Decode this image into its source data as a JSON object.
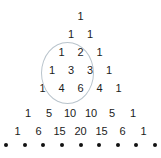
{
  "figure": {
    "name": "pascals-triangle-with-highlight",
    "background_color": "#ffffff",
    "text_color": "#1b1b1b",
    "highlight_color": "#b9c4cc",
    "dot_color": "#111111"
  },
  "chart_data": {
    "type": "table",
    "title": "",
    "subtitle": "",
    "xlabel": "",
    "ylabel": "",
    "grid": false,
    "legend": null,
    "rows": [
      {
        "index": 0,
        "values": [
          1
        ]
      },
      {
        "index": 1,
        "values": [
          1,
          1
        ]
      },
      {
        "index": 2,
        "values": [
          1,
          2,
          1
        ]
      },
      {
        "index": 3,
        "values": [
          1,
          3,
          3,
          1
        ]
      },
      {
        "index": 4,
        "values": [
          1,
          4,
          6,
          4,
          1
        ]
      },
      {
        "index": 5,
        "values": [
          1,
          5,
          10,
          10,
          5,
          1
        ]
      },
      {
        "index": 6,
        "values": [
          1,
          6,
          15,
          20,
          15,
          6,
          1
        ]
      }
    ],
    "continuation_dots": [
      "•",
      "•",
      "•",
      "•",
      "•",
      "•",
      "•",
      "•",
      "•"
    ],
    "highlight": {
      "shape": "ellipse",
      "color": "#b9c4cc",
      "encircled_values": [
        1,
        2,
        1,
        3,
        3,
        4,
        6
      ]
    }
  },
  "cells": {
    "r0": [
      "1"
    ],
    "r1": [
      "1",
      "1"
    ],
    "r2": [
      "1",
      "2",
      "1"
    ],
    "r3": [
      "1",
      "3",
      "3",
      "1"
    ],
    "r4": [
      "1",
      "4",
      "6",
      "4",
      "1"
    ],
    "r5": [
      "1",
      "5",
      "10",
      "10",
      "5",
      "1"
    ],
    "r6": [
      "1",
      "6",
      "15",
      "20",
      "15",
      "6",
      "1"
    ]
  }
}
